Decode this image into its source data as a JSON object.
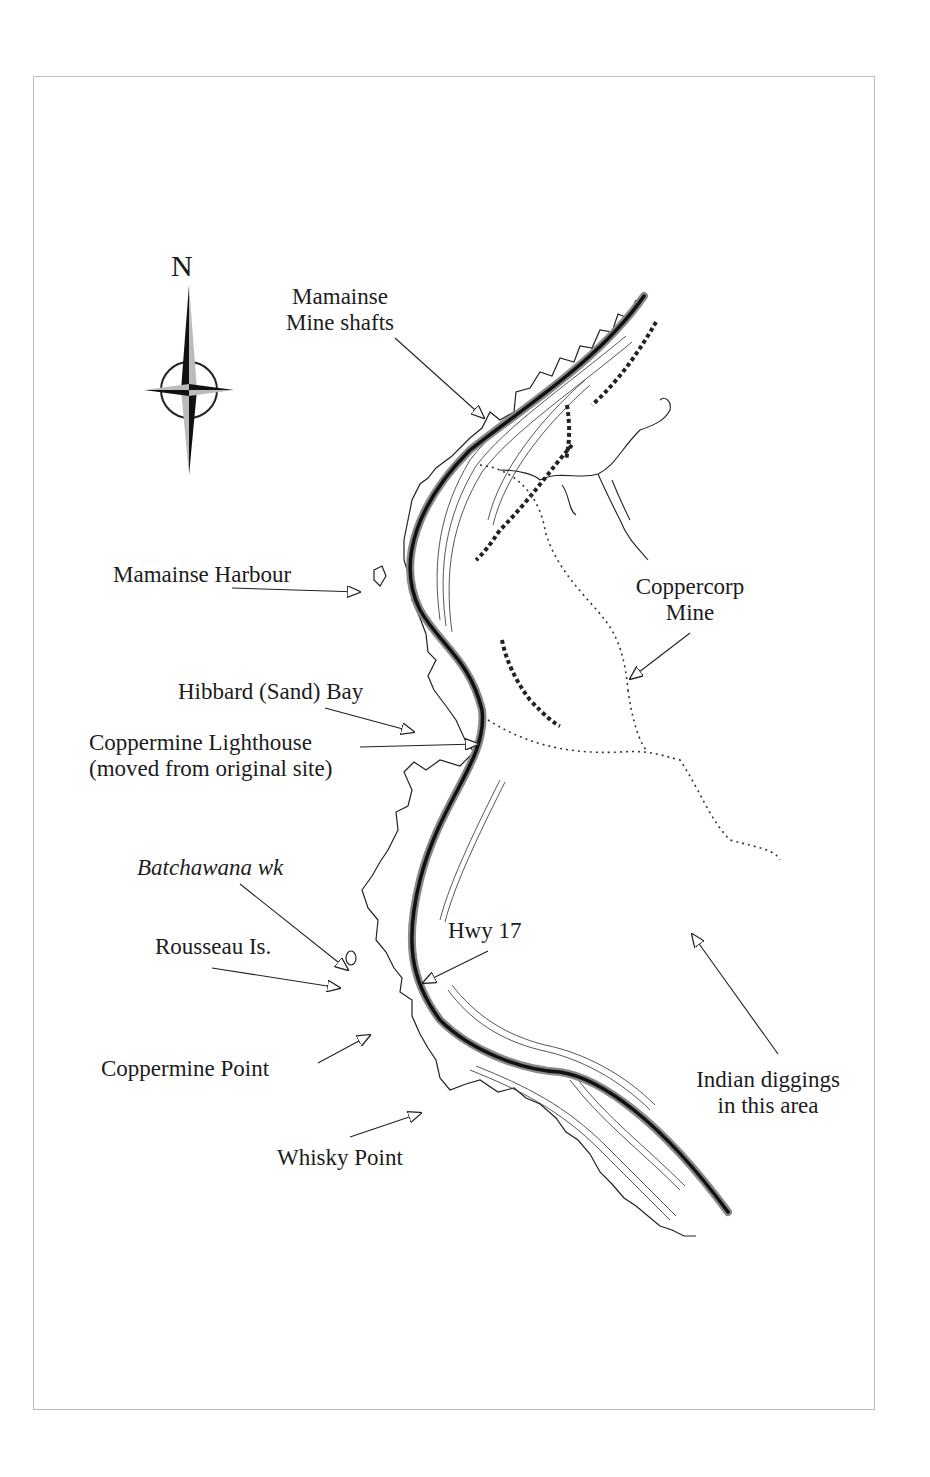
{
  "map": {
    "compass": {
      "north_label": "N",
      "icon": "compass-rose-icon"
    },
    "labels": {
      "mamainse_mine_shafts": [
        "Mamainse",
        "Mine shafts"
      ],
      "mamainse_harbour": "Mamainse  Harbour",
      "coppercorp_mine": [
        "Coppercorp",
        "Mine"
      ],
      "hibbard_bay": "Hibbard (Sand) Bay",
      "coppermine_lighthouse": [
        "Coppermine Lighthouse",
        "(moved from original site)"
      ],
      "batchawana_wk": "Batchawana wk",
      "rousseau_is": "Rousseau Is.",
      "hwy_17": "Hwy 17",
      "coppermine_point": "Coppermine Point",
      "indian_diggings": [
        "Indian diggings",
        "in this area"
      ],
      "whisky_point": "Whisky Point"
    },
    "colors": {
      "ink": "#1a1a1a",
      "frame": "#bdbdbd",
      "background": "#ffffff"
    }
  }
}
